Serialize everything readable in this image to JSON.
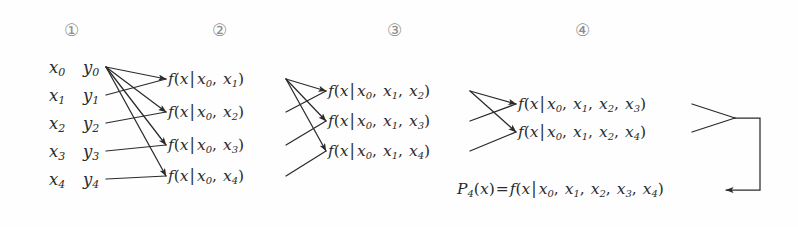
{
  "diagram": {
    "background_color": "#fefefe",
    "ink_color": "#2b2b2b",
    "header_color": "#8d8d8d",
    "column_headers": [
      {
        "id": "col-1",
        "label": "①",
        "x": 72
      },
      {
        "id": "col-2",
        "label": "②",
        "x": 220
      },
      {
        "id": "col-3",
        "label": "③",
        "x": 395
      },
      {
        "id": "col-4",
        "label": "④",
        "x": 583
      }
    ],
    "data_points": [
      {
        "x_label": "x",
        "x_sub": "0",
        "y_label": "y",
        "y_sub": "0",
        "row": 0
      },
      {
        "x_label": "x",
        "x_sub": "1",
        "y_label": "y",
        "y_sub": "1",
        "row": 1
      },
      {
        "x_label": "x",
        "x_sub": "2",
        "y_label": "y",
        "y_sub": "2",
        "row": 2
      },
      {
        "x_label": "x",
        "x_sub": "3",
        "y_label": "y",
        "y_sub": "3",
        "row": 3
      },
      {
        "x_label": "x",
        "x_sub": "4",
        "y_label": "y",
        "y_sub": "4",
        "row": 4
      }
    ],
    "column2_nodes": [
      {
        "id": "f-x0-x1",
        "args": [
          "0",
          "1"
        ]
      },
      {
        "id": "f-x0-x2",
        "args": [
          "0",
          "2"
        ]
      },
      {
        "id": "f-x0-x3",
        "args": [
          "0",
          "3"
        ]
      },
      {
        "id": "f-x0-x4",
        "args": [
          "0",
          "4"
        ]
      }
    ],
    "column3_nodes": [
      {
        "id": "f-x0-x1-x2",
        "args": [
          "0",
          "1",
          "2"
        ]
      },
      {
        "id": "f-x0-x1-x3",
        "args": [
          "0",
          "1",
          "3"
        ]
      },
      {
        "id": "f-x0-x1-x4",
        "args": [
          "0",
          "1",
          "4"
        ]
      }
    ],
    "column4_nodes": [
      {
        "id": "f-x0-x1-x2-x3",
        "args": [
          "0",
          "1",
          "2",
          "3"
        ]
      },
      {
        "id": "f-x0-x1-x2-x4",
        "args": [
          "0",
          "1",
          "2",
          "4"
        ]
      }
    ],
    "result": {
      "id": "p4-result",
      "p_label": "P",
      "p_sub": "4",
      "p_arg": "x",
      "equals": "=",
      "f_label": "f",
      "f_var": "x",
      "bar": "|",
      "args": [
        "0",
        "1",
        "2",
        "3",
        "4"
      ]
    },
    "symbols": {
      "f": "f",
      "x": "x",
      "bar": "|",
      "comma": ",",
      "open_paren": "(",
      "close_paren": ")"
    }
  }
}
